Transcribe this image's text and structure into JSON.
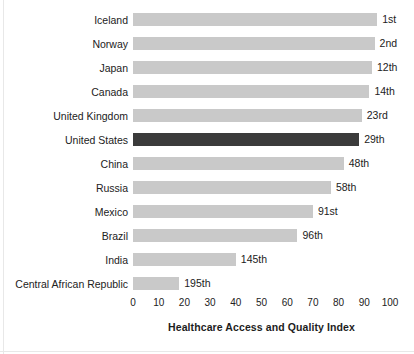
{
  "chart_data": {
    "type": "bar",
    "orientation": "horizontal",
    "title": "",
    "xlabel": "Healthcare Access and Quality Index",
    "ylabel": "",
    "xlim": [
      0,
      100
    ],
    "xticks": [
      0,
      10,
      20,
      30,
      40,
      50,
      60,
      70,
      80,
      90,
      100
    ],
    "grid": false,
    "legend": "none",
    "categories": [
      "Iceland",
      "Norway",
      "Japan",
      "Canada",
      "United Kingdom",
      "United States",
      "China",
      "Russia",
      "Mexico",
      "Brazil",
      "India",
      "Central African Republic"
    ],
    "values": [
      95,
      94,
      93,
      92,
      89,
      88,
      82,
      77,
      70,
      64,
      40,
      18
    ],
    "point_labels": [
      "1st",
      "2nd",
      "12th",
      "14th",
      "23rd",
      "29th",
      "48th",
      "58th",
      "91st",
      "96th",
      "145th",
      "195th"
    ],
    "highlighted_category": "United States",
    "colors": {
      "bar": "#c9c9c9",
      "bar_highlight": "#3b3b3b",
      "text": "#222222",
      "background": "#ffffff"
    }
  }
}
